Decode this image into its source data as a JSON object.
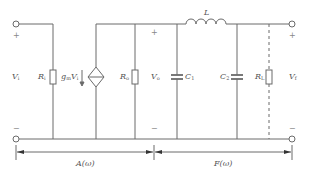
{
  "diagram": {
    "type": "circuit-schematic",
    "colors": {
      "wire": "#6a6a6a",
      "text": "#555555"
    },
    "labels": {
      "vi": "V",
      "vi_sub": "i",
      "ri": "R",
      "ri_sub": "i",
      "gm": "g",
      "gm_sub": "m",
      "gm_v": "V",
      "gm_v_sub": "i",
      "ro": "R",
      "ro_sub": "o",
      "vo": "V",
      "vo_sub": "o",
      "inductor": "L",
      "c1": "C",
      "c1_sub": "1",
      "c2": "C",
      "c2_sub": "2",
      "rl": "R",
      "rl_sub": "L",
      "vf": "V",
      "vf_sub": "f",
      "plus": "+",
      "minus": "−"
    },
    "dimension_labels": {
      "amplifier": "A(ω)",
      "feedback": "F(ω)"
    },
    "components": [
      {
        "id": "Ri",
        "kind": "resistor",
        "label": "Ri"
      },
      {
        "id": "gmVi",
        "kind": "dependent-current-source",
        "label": "gmVi"
      },
      {
        "id": "Ro",
        "kind": "resistor",
        "label": "Ro"
      },
      {
        "id": "C1",
        "kind": "capacitor",
        "label": "C1"
      },
      {
        "id": "L",
        "kind": "inductor",
        "label": "L"
      },
      {
        "id": "C2",
        "kind": "capacitor",
        "label": "C2"
      },
      {
        "id": "RL",
        "kind": "resistor",
        "label": "RL",
        "connection": "dashed"
      }
    ]
  }
}
